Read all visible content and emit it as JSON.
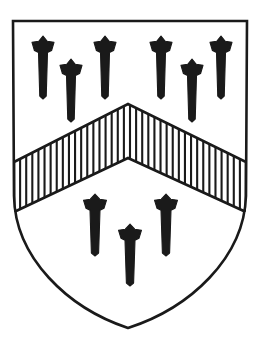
{
  "image": {
    "title": "Heraldic shield (coat of arms)",
    "kind": "line-drawing",
    "width": 259,
    "height": 343,
    "background_color": "#ffffff",
    "ink_color": "#1a1a1a"
  },
  "shield": {
    "name": "escutcheon",
    "outline_color": "#1a1a1a",
    "field_color": "#ffffff",
    "outline_width": 2.6,
    "geometry": {
      "top_left": [
        13,
        21
      ],
      "top_right": [
        247,
        21
      ],
      "bottom_point": [
        128,
        328
      ],
      "left_flank_x": 14,
      "right_flank_x": 246,
      "flank_straight_until_y": 196,
      "left_curve_c1": [
        15,
        258
      ],
      "left_curve_c2": [
        68,
        308
      ],
      "right_curve_c1": [
        244,
        258
      ],
      "right_curve_c2": [
        190,
        308
      ]
    }
  },
  "ordinary": {
    "name": "chevron",
    "blazon_tincture": "gules",
    "hatching": "vertical-lines",
    "hatching_meaning": "gules (red)",
    "hatch_stripe_count": 38,
    "hatch_line_color": "#1a1a1a",
    "hatch_line_width": 2.1,
    "fill_color": "#ffffff",
    "outline_color": "#1a1a1a",
    "outline_width": 2.6,
    "geometry": {
      "apex_top": [
        128,
        104
      ],
      "apex_bottom": [
        128,
        158
      ],
      "left_outer_top": [
        14,
        162
      ],
      "left_outer_bottom": [
        14,
        212
      ],
      "right_outer_top": [
        246,
        162
      ],
      "right_outer_bottom": [
        246,
        212
      ]
    }
  },
  "charges": {
    "name": "passion nails",
    "count_total": 9,
    "count_in_chief": 6,
    "count_in_base": 3,
    "color": "#1a1a1a",
    "arrangement_chief": "four-and-two",
    "arrangement_base": "two-and-one",
    "in_chief": [
      {
        "id": "chief-nail-1",
        "x": 43,
        "y": 36,
        "height": 63,
        "width": 9,
        "head_width": 22
      },
      {
        "id": "chief-nail-2",
        "x": 105,
        "y": 36,
        "height": 63,
        "width": 9,
        "head_width": 22
      },
      {
        "id": "chief-nail-3",
        "x": 161,
        "y": 36,
        "height": 63,
        "width": 9,
        "head_width": 22
      },
      {
        "id": "chief-nail-4",
        "x": 221,
        "y": 36,
        "height": 63,
        "width": 9,
        "head_width": 22
      },
      {
        "id": "chief-nail-5",
        "x": 71,
        "y": 59,
        "height": 63,
        "width": 9,
        "head_width": 22
      },
      {
        "id": "chief-nail-6",
        "x": 192,
        "y": 59,
        "height": 63,
        "width": 9,
        "head_width": 22
      }
    ],
    "in_base": [
      {
        "id": "base-nail-1",
        "x": 95,
        "y": 194,
        "height": 62,
        "width": 10,
        "head_width": 23
      },
      {
        "id": "base-nail-2",
        "x": 166,
        "y": 194,
        "height": 62,
        "width": 10,
        "head_width": 23
      },
      {
        "id": "base-nail-3",
        "x": 130,
        "y": 224,
        "height": 62,
        "width": 10,
        "head_width": 23
      }
    ]
  }
}
